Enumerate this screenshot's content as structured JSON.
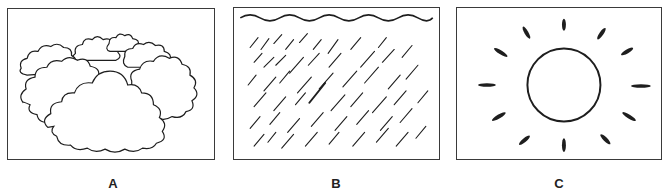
{
  "panels": [
    {
      "id": "A",
      "label": "A",
      "depicts": "cloudy-sky",
      "icon": "clouds-icon"
    },
    {
      "id": "B",
      "label": "B",
      "depicts": "rain",
      "icon": "rain-icon"
    },
    {
      "id": "C",
      "label": "C",
      "depicts": "sunny",
      "icon": "sun-icon"
    }
  ],
  "colors": {
    "stroke": "#1e1e1e",
    "frame": "#3a3a3a",
    "background": "#ffffff"
  }
}
